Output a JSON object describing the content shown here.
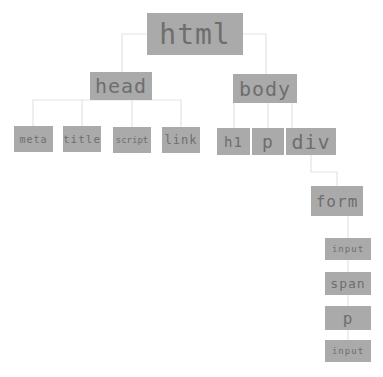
{
  "diagram": {
    "type": "DOM tree",
    "colors": {
      "node_fill": "#aaaaaa",
      "node_text": "#6e6e6e",
      "connector": "#e6e6e6",
      "background": "#ffffff"
    },
    "nodes": {
      "html": "html",
      "head": "head",
      "body": "body",
      "meta": "meta",
      "title": "title",
      "script": "script",
      "link": "link",
      "h1": "h1",
      "p": "p",
      "div": "div",
      "form": "form",
      "input1": "input",
      "span": "span",
      "p2": "p",
      "input2": "input"
    },
    "edges": [
      [
        "html",
        "head"
      ],
      [
        "html",
        "body"
      ],
      [
        "head",
        "meta"
      ],
      [
        "head",
        "title"
      ],
      [
        "head",
        "script"
      ],
      [
        "head",
        "link"
      ],
      [
        "body",
        "h1"
      ],
      [
        "body",
        "p"
      ],
      [
        "body",
        "div"
      ],
      [
        "div",
        "form"
      ],
      [
        "form",
        "input1"
      ],
      [
        "form",
        "span"
      ],
      [
        "form",
        "p2"
      ],
      [
        "form",
        "input2"
      ]
    ]
  }
}
